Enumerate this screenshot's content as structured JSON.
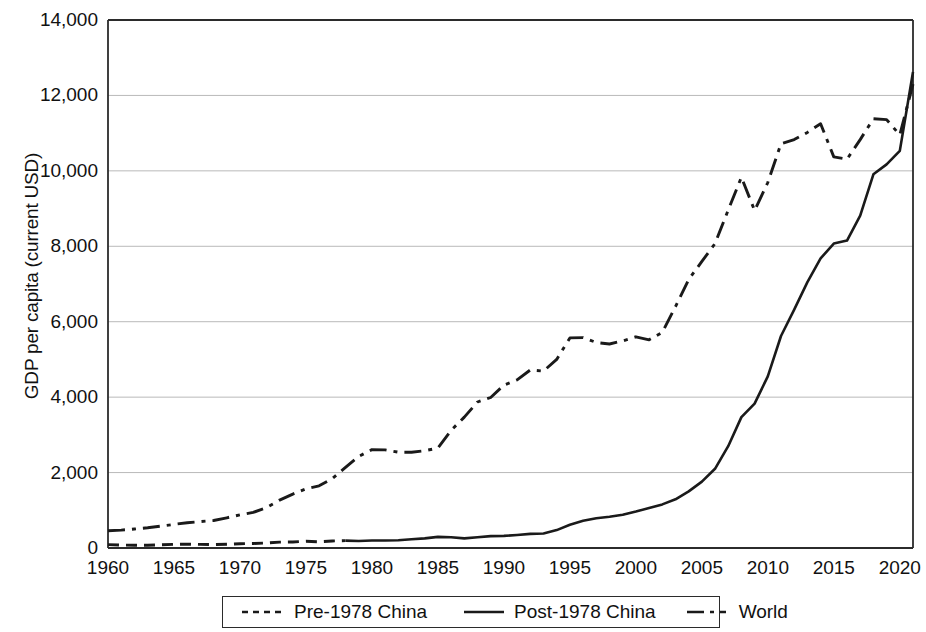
{
  "chart_data": {
    "type": "line",
    "title": "",
    "xlabel": "",
    "ylabel": "GDP per capita (current USD)",
    "xlim": [
      1960,
      2021
    ],
    "ylim": [
      0,
      14000
    ],
    "ytick_labels": [
      "14,000",
      "12,000",
      "10,000",
      "8,000",
      "6,000",
      "4,000",
      "2,000",
      "0"
    ],
    "ytick_values": [
      14000,
      12000,
      10000,
      8000,
      6000,
      4000,
      2000,
      0
    ],
    "xtick_labels": [
      "1960",
      "1965",
      "1970",
      "1975",
      "1980",
      "1985",
      "1990",
      "1995",
      "2000",
      "2005",
      "2010",
      "2015",
      "2020"
    ],
    "xtick_values": [
      1960,
      1965,
      1970,
      1975,
      1980,
      1985,
      1990,
      1995,
      2000,
      2005,
      2010,
      2015,
      2020
    ],
    "grid": "horizontal",
    "legend_position": "below-center",
    "line_color": "#1a1a1a",
    "grid_color": "#b9b9b9",
    "axis_color": "#2b2b2b",
    "series": [
      {
        "name": "Pre-1978 China",
        "style": "dashed",
        "x": [
          1960,
          1961,
          1962,
          1963,
          1964,
          1965,
          1966,
          1967,
          1968,
          1969,
          1970,
          1971,
          1972,
          1973,
          1974,
          1975,
          1976,
          1977,
          1978
        ],
        "values": [
          90,
          76,
          71,
          74,
          86,
          98,
          104,
          96,
          92,
          100,
          113,
          119,
          132,
          157,
          160,
          178,
          165,
          185,
          195
        ]
      },
      {
        "name": "Post-1978 China",
        "style": "solid",
        "x": [
          1978,
          1979,
          1980,
          1981,
          1982,
          1983,
          1984,
          1985,
          1986,
          1987,
          1988,
          1989,
          1990,
          1991,
          1992,
          1993,
          1994,
          1995,
          1996,
          1997,
          1998,
          1999,
          2000,
          2001,
          2002,
          2003,
          2004,
          2005,
          2006,
          2007,
          2008,
          2009,
          2010,
          2011,
          2012,
          2013,
          2014,
          2015,
          2016,
          2017,
          2018,
          2019,
          2020,
          2021
        ],
        "values": [
          195,
          185,
          200,
          200,
          205,
          230,
          255,
          295,
          285,
          255,
          285,
          315,
          320,
          345,
          375,
          385,
          475,
          615,
          720,
          790,
          830,
          880,
          965,
          1060,
          1155,
          1290,
          1500,
          1760,
          2100,
          2700,
          3470,
          3830,
          4550,
          5620,
          6320,
          7050,
          7680,
          8070,
          8150,
          8810,
          9910,
          10170,
          10530,
          12620
        ]
      },
      {
        "name": "World",
        "style": "dash-dot",
        "x": [
          1960,
          1961,
          1962,
          1963,
          1964,
          1965,
          1966,
          1967,
          1968,
          1969,
          1970,
          1971,
          1972,
          1973,
          1974,
          1975,
          1976,
          1977,
          1978,
          1979,
          1980,
          1981,
          1982,
          1983,
          1984,
          1985,
          1986,
          1987,
          1988,
          1989,
          1990,
          1991,
          1992,
          1993,
          1994,
          1995,
          1996,
          1997,
          1998,
          1999,
          2000,
          2001,
          2002,
          2003,
          2004,
          2005,
          2006,
          2007,
          2008,
          2009,
          2010,
          2011,
          2012,
          2013,
          2014,
          2015,
          2016,
          2017,
          2018,
          2019,
          2020,
          2021
        ],
        "values": [
          460,
          475,
          505,
          535,
          580,
          625,
          670,
          700,
          730,
          800,
          880,
          945,
          1070,
          1270,
          1430,
          1570,
          1650,
          1840,
          2140,
          2430,
          2610,
          2600,
          2540,
          2540,
          2580,
          2650,
          3120,
          3470,
          3870,
          3990,
          4320,
          4460,
          4720,
          4690,
          5000,
          5570,
          5580,
          5450,
          5410,
          5490,
          5600,
          5520,
          5720,
          6400,
          7120,
          7600,
          8070,
          8960,
          9830,
          8950,
          9690,
          10720,
          10830,
          11020,
          11250,
          10370,
          10310,
          10830,
          11380,
          11360,
          10950,
          12300
        ]
      }
    ]
  },
  "axes": {
    "y_title": "GDP per capita (current USD)"
  },
  "legend": {
    "items": [
      {
        "label": "Pre-1978 China",
        "style": "dashed"
      },
      {
        "label": "Post-1978 China",
        "style": "solid"
      },
      {
        "label": "World",
        "style": "dash-dot"
      }
    ]
  }
}
